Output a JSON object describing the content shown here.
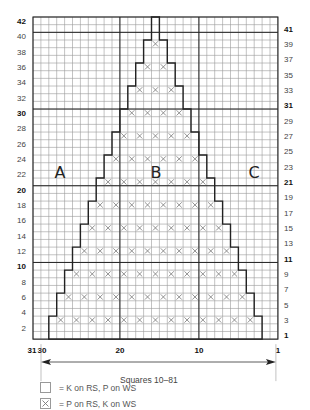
{
  "chart_data": {
    "type": "knitting-chart",
    "title": "",
    "grid": {
      "columns": 31,
      "rows": 42
    },
    "x_axis": {
      "direction": "right-to-left",
      "tick_labels": [
        {
          "stitch": 31,
          "label": "31"
        },
        {
          "stitch": 30,
          "label": "30"
        },
        {
          "stitch": 20,
          "label": "20"
        },
        {
          "stitch": 10,
          "label": "10"
        },
        {
          "stitch": 1,
          "label": "1"
        }
      ],
      "caption": "Squares 10–81"
    },
    "y_axis_left": {
      "labels": [
        "2",
        "4",
        "6",
        "8",
        "10",
        "12",
        "14",
        "16",
        "18",
        "20",
        "22",
        "24",
        "26",
        "28",
        "30",
        "32",
        "34",
        "36",
        "38",
        "40",
        "42"
      ],
      "bold": [
        "10",
        "20",
        "30",
        "42"
      ]
    },
    "y_axis_right": {
      "labels": [
        "1",
        "3",
        "5",
        "7",
        "9",
        "11",
        "13",
        "15",
        "17",
        "19",
        "21",
        "23",
        "25",
        "27",
        "29",
        "31",
        "33",
        "35",
        "37",
        "39",
        "41"
      ],
      "bold": [
        "1",
        "11",
        "21",
        "31",
        "41"
      ]
    },
    "bold_row_lines_after_rows": [
      10,
      20,
      30,
      40
    ],
    "bold_col_lines_after_stitch": [
      20,
      10
    ],
    "triangle": {
      "description": "Stepped triangle, 27 stitches wide at rows 1–3, narrowing 1 stitch per side every 3 rows to 1 stitch at rows 40–42",
      "steps": [
        {
          "rows": "1-3",
          "stitches": "3-29"
        },
        {
          "rows": "4-6",
          "stitches": "4-28"
        },
        {
          "rows": "7-9",
          "stitches": "5-27"
        },
        {
          "rows": "10-12",
          "stitches": "6-26"
        },
        {
          "rows": "13-15",
          "stitches": "7-25"
        },
        {
          "rows": "16-18",
          "stitches": "8-24"
        },
        {
          "rows": "19-21",
          "stitches": "9-23"
        },
        {
          "rows": "22-24",
          "stitches": "10-22"
        },
        {
          "rows": "25-27",
          "stitches": "11-21"
        },
        {
          "rows": "28-30",
          "stitches": "12-20"
        },
        {
          "rows": "31-33",
          "stitches": "13-19"
        },
        {
          "rows": "34-36",
          "stitches": "14-18"
        },
        {
          "rows": "37-39",
          "stitches": "15-17"
        },
        {
          "rows": "40-42",
          "stitches": "16-16"
        }
      ],
      "purl_rows": [
        3,
        6,
        9,
        12,
        15,
        18,
        21,
        24,
        27,
        30,
        33,
        36,
        39
      ]
    },
    "region_labels": [
      "A",
      "B",
      "C"
    ]
  },
  "legend": [
    {
      "symbol": "empty-square",
      "text": "= K on RS, P on WS"
    },
    {
      "symbol": "x-square",
      "text": "= P on RS, K on WS"
    }
  ],
  "colors": {
    "grid": "#9a9a9a",
    "bold": "#222222",
    "x_mark": "#777777",
    "background": "#ffffff"
  }
}
